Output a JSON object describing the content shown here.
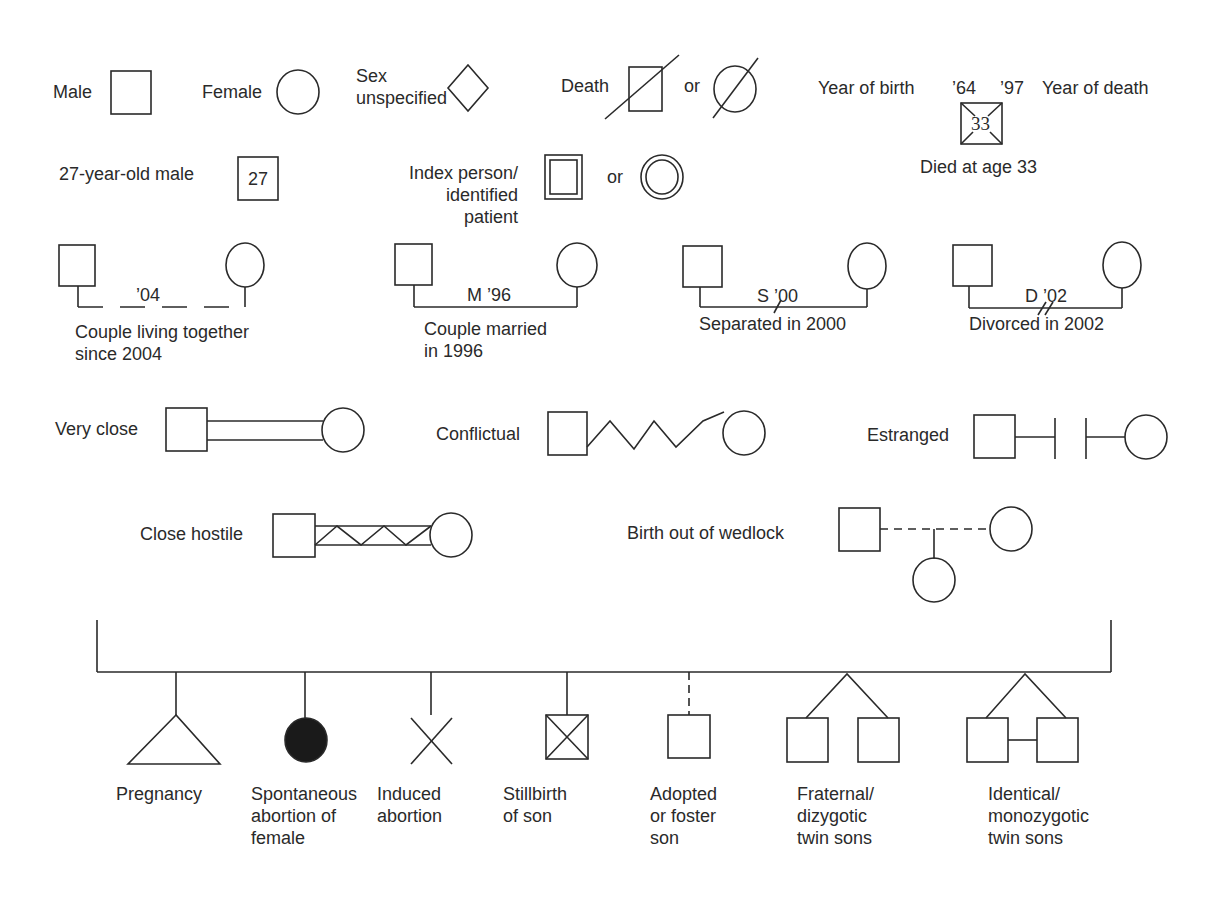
{
  "colors": {
    "stroke": "#2a2a2a",
    "fill_dark": "#1a1a1a",
    "background": "#ffffff"
  },
  "basic": {
    "male": "Male",
    "female": "Female",
    "sex_unspecified": "Sex\nunspecified",
    "death": "Death",
    "death_or": "or",
    "year_of_birth": "Year of birth",
    "birth_year": "’64",
    "death_year": "’97",
    "year_of_death": "Year of death",
    "died_age": "33",
    "died_at_age": "Died at age 33",
    "age_male": "27-year-old male",
    "age_value": "27",
    "index_person": "Index person/\nidentified patient",
    "index_or": "or"
  },
  "couples": [
    {
      "label": "Couple living together\nsince 2004",
      "line_label": "’04",
      "type": "cohabiting"
    },
    {
      "label": "Couple married\nin 1996",
      "line_label": "M ’96",
      "type": "married"
    },
    {
      "label": "Separated in 2000",
      "line_label": "S ’00",
      "type": "separated"
    },
    {
      "label": "Divorced in 2002",
      "line_label": "D ’02",
      "type": "divorced"
    }
  ],
  "relationships": [
    {
      "label": "Very close",
      "type": "very-close"
    },
    {
      "label": "Conflictual",
      "type": "conflictual"
    },
    {
      "label": "Estranged",
      "type": "estranged"
    },
    {
      "label": "Close hostile",
      "type": "close-hostile"
    },
    {
      "label": "Birth out of wedlock",
      "type": "birth-out-of-wedlock"
    }
  ],
  "offspring": [
    {
      "label": "Pregnancy",
      "symbol": "triangle"
    },
    {
      "label": "Spontaneous\nabortion of\nfemale",
      "symbol": "filled-circle"
    },
    {
      "label": "Induced\nabortion",
      "symbol": "x-mark"
    },
    {
      "label": "Stillbirth\nof son",
      "symbol": "crossed-square"
    },
    {
      "label": "Adopted\nor foster\nson",
      "symbol": "dashed-square"
    },
    {
      "label": "Fraternal/\ndizygotic\ntwin sons",
      "symbol": "twin-squares"
    },
    {
      "label": "Identical/\nmonozygotic\ntwin sons",
      "symbol": "linked-twin-squares"
    }
  ]
}
